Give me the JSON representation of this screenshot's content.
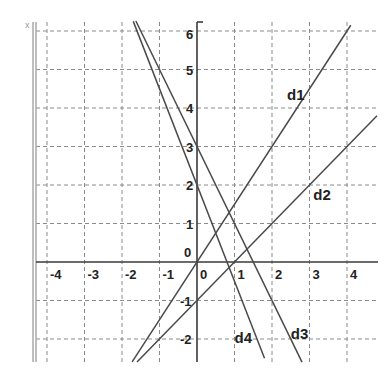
{
  "chart_data": {
    "type": "line",
    "title": "",
    "xlabel": "",
    "ylabel": "",
    "xlim": [
      -4.3,
      4.8
    ],
    "ylim": [
      -2.6,
      6
    ],
    "grid": true,
    "x_ticks": [
      -4,
      -3,
      -2,
      -1,
      0,
      1,
      2,
      3,
      4
    ],
    "y_ticks": [
      -2,
      -1,
      0,
      1,
      2,
      3,
      4,
      5,
      6
    ],
    "x_tick_labels": [
      "-4",
      "-3",
      "-2",
      "-1",
      "0",
      "1",
      "2",
      "3",
      "4"
    ],
    "y_tick_labels": [
      "-2",
      "-1",
      "0",
      "1",
      "2",
      "3",
      "4",
      "5",
      "6"
    ],
    "origin_label": "0",
    "corner_mark": "x",
    "series": [
      {
        "name": "d1",
        "equation": "y = 1.5x",
        "slope": 1.5,
        "intercept": 0,
        "x_range": [
          -1.73,
          4.1
        ]
      },
      {
        "name": "d2",
        "equation": "y = x - 1",
        "slope": 1,
        "intercept": -1,
        "x_range": [
          -1.6,
          4.8
        ]
      },
      {
        "name": "d3",
        "equation": "y = -2x + 3",
        "slope": -2,
        "intercept": 3,
        "x_range": [
          -1.63,
          2.8
        ]
      },
      {
        "name": "d4",
        "equation": "y = -2.5x + 2",
        "slope": -2.5,
        "intercept": 2,
        "x_range": [
          -1.7,
          1.8
        ]
      }
    ],
    "labels": [
      {
        "text": "d1",
        "x": 2.4,
        "y": 4.2
      },
      {
        "text": "d2",
        "x": 3.1,
        "y": 1.6
      },
      {
        "text": "d3",
        "x": 2.5,
        "y": -2.0
      },
      {
        "text": "d4",
        "x": 1.0,
        "y": -2.1
      }
    ]
  }
}
